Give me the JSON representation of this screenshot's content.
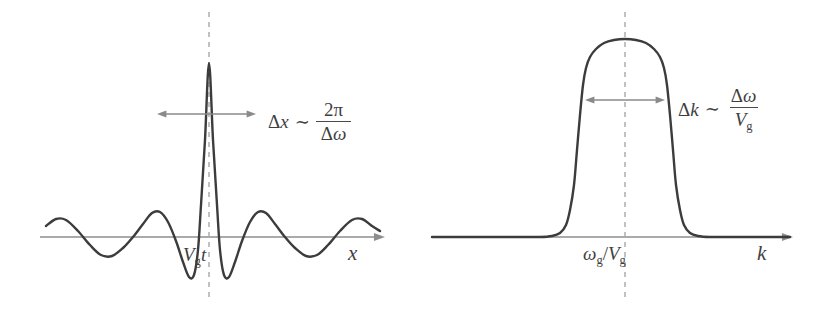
{
  "figure": {
    "background_color": "#ffffff",
    "curve_color": "#3c3c3c",
    "axis_color": "#8e8e8e",
    "dashed_color": "#a8a8a8",
    "text_color": "#3f3f3f"
  },
  "panels": {
    "left": {
      "name": "position-space-wave-packet",
      "axis_label": "x",
      "centre_label": {
        "symbol": "V",
        "subscript": "g",
        "suffix": "t",
        "text": "Vgt"
      },
      "relation": {
        "lhs_delta": "Δ",
        "lhs_var": "x",
        "tilde": "∼",
        "numerator": "2π",
        "denominator_delta": "Δ",
        "denominator_var": "ω",
        "text": "Δx ∼ 2π/Δω"
      }
    },
    "right": {
      "name": "wavenumber-space-spectrum",
      "axis_label": "k",
      "centre_label": {
        "symbol": "ω",
        "subscript": "g",
        "separator": "/",
        "symbol2": "V",
        "subscript2": "g",
        "text": "ωg/Vg"
      },
      "relation": {
        "lhs_delta": "Δ",
        "lhs_var": "k",
        "tilde": "∼",
        "numerator_delta": "Δ",
        "numerator_var": "ω",
        "denominator_var": "V",
        "denominator_sub": "g",
        "text": "Δk ∼ Δω/Vg"
      }
    }
  },
  "chart_data": [
    {
      "type": "line",
      "name": "wave-packet-position-space",
      "panel": "left",
      "title": "",
      "xlabel": "x",
      "ylabel": "",
      "function": "sinc-like modulated wave packet",
      "formula": "A * sin(pi*u)/(pi*u) with u = (x - x0)/w",
      "baseline_y": 237,
      "centre_x": 209,
      "peak_y": 63,
      "amplitude_px": 174,
      "lobe_half_width_px": 48,
      "x_domain_px": [
        46,
        380
      ],
      "grid": false,
      "legend": null,
      "annotations": [
        {
          "text": "Vgt",
          "at_x": 209,
          "at_y": 258,
          "role": "centre-tick-label"
        },
        {
          "text": "Δx ∼ 2π/Δω",
          "at_x": 268,
          "at_y": 114,
          "role": "width-relation"
        }
      ],
      "span_arrow": {
        "y": 114,
        "x_start": 157,
        "x_end": 256
      },
      "dashed_centre": {
        "x": 209,
        "y_start": 12,
        "y_end": 300
      },
      "axis_arrow": {
        "y": 237,
        "x_start": 40,
        "x_end": 385
      },
      "x": [
        -4.0,
        -3.75,
        -3.5,
        -3.25,
        -3.0,
        -2.75,
        -2.5,
        -2.25,
        -2.0,
        -1.75,
        -1.5,
        -1.25,
        -1.0,
        -0.75,
        -0.5,
        -0.25,
        0.0,
        0.25,
        0.5,
        0.75,
        1.0,
        1.25,
        1.5,
        1.75,
        2.0,
        2.25,
        2.5,
        2.75,
        3.0,
        3.25,
        3.5,
        3.75,
        4.0
      ],
      "y": [
        0.0,
        0.075,
        0.091,
        0.038,
        0.0,
        -0.089,
        -0.127,
        -0.069,
        0.0,
        0.127,
        0.212,
        0.129,
        0.0,
        -0.3,
        -0.637,
        -0.42,
        0.0,
        1.0,
        1.0,
        0.9,
        0.0,
        -0.3,
        -0.637,
        -0.42,
        0.0,
        0.127,
        0.212,
        0.129,
        0.0,
        -0.089,
        -0.127,
        -0.069,
        0.0
      ],
      "sample_points_px": [
        [
          46,
          226
        ],
        [
          56,
          219
        ],
        [
          66,
          220
        ],
        [
          78,
          231
        ],
        [
          90,
          245
        ],
        [
          101,
          255
        ],
        [
          112,
          256
        ],
        [
          123,
          248
        ],
        [
          133,
          237
        ],
        [
          143,
          224
        ],
        [
          152,
          213
        ],
        [
          160,
          212
        ],
        [
          168,
          222
        ],
        [
          176,
          241
        ],
        [
          183,
          262
        ],
        [
          189,
          277
        ],
        [
          194,
          275
        ],
        [
          198,
          250
        ],
        [
          201,
          205
        ],
        [
          205,
          140
        ],
        [
          209,
          63
        ],
        [
          213,
          140
        ],
        [
          217,
          205
        ],
        [
          220,
          250
        ],
        [
          224,
          275
        ],
        [
          229,
          277
        ],
        [
          235,
          262
        ],
        [
          242,
          241
        ],
        [
          250,
          222
        ],
        [
          258,
          212
        ],
        [
          266,
          213
        ],
        [
          275,
          224
        ],
        [
          285,
          237
        ],
        [
          295,
          248
        ],
        [
          306,
          256
        ],
        [
          317,
          255
        ],
        [
          328,
          245
        ],
        [
          340,
          231
        ],
        [
          352,
          220
        ],
        [
          362,
          219
        ],
        [
          372,
          226
        ],
        [
          380,
          231
        ]
      ]
    },
    {
      "type": "line",
      "name": "spectrum-wavenumber-space",
      "panel": "right",
      "title": "",
      "xlabel": "k",
      "ylabel": "",
      "function": "flat-top super-Gaussian spectrum",
      "formula": "exp(-((k - k0)/w)^8)",
      "baseline_y": 237,
      "centre_x": 625,
      "peak_y": 39,
      "amplitude_px": 198,
      "flat_top_half_width_px": 40,
      "x_domain_px": [
        432,
        790
      ],
      "grid": false,
      "legend": null,
      "annotations": [
        {
          "text": "ωg/Vg",
          "at_x": 625,
          "at_y": 258,
          "role": "centre-tick-label"
        },
        {
          "text": "Δk ∼ Δω/Vg",
          "at_x": 678,
          "at_y": 100,
          "role": "width-relation"
        }
      ],
      "span_arrow": {
        "y": 100,
        "x_start": 585,
        "x_end": 665
      },
      "dashed_centre": {
        "x": 625,
        "y_start": 12,
        "y_end": 300
      },
      "axis_arrow": {
        "y": 237,
        "x_start": 432,
        "x_end": 793
      },
      "x": [
        -3.0,
        -2.5,
        -2.0,
        -1.8,
        -1.6,
        -1.4,
        -1.3,
        -1.2,
        -1.1,
        -1.0,
        -0.9,
        -0.8,
        -0.6,
        -0.4,
        -0.2,
        0.0,
        0.2,
        0.4,
        0.6,
        0.8,
        0.9,
        1.0,
        1.1,
        1.2,
        1.3,
        1.4,
        1.6,
        1.8,
        2.0,
        2.5,
        3.0
      ],
      "y": [
        0.0,
        0.0,
        0.0,
        0.0,
        0.002,
        0.01,
        0.03,
        0.09,
        0.22,
        0.45,
        0.7,
        0.87,
        0.975,
        0.995,
        1.0,
        1.0,
        1.0,
        0.995,
        0.975,
        0.87,
        0.7,
        0.45,
        0.22,
        0.09,
        0.03,
        0.01,
        0.002,
        0.0,
        0.0,
        0.0,
        0.0
      ],
      "sample_points_px": [
        [
          432,
          237
        ],
        [
          470,
          237
        ],
        [
          510,
          237
        ],
        [
          540,
          237
        ],
        [
          552,
          236
        ],
        [
          560,
          233
        ],
        [
          566,
          225
        ],
        [
          570,
          210
        ],
        [
          574,
          185
        ],
        [
          577,
          150
        ],
        [
          580,
          115
        ],
        [
          583,
          85
        ],
        [
          586,
          68
        ],
        [
          590,
          57
        ],
        [
          596,
          49
        ],
        [
          604,
          43
        ],
        [
          614,
          40
        ],
        [
          625,
          39
        ],
        [
          636,
          40
        ],
        [
          646,
          43
        ],
        [
          654,
          49
        ],
        [
          660,
          57
        ],
        [
          664,
          68
        ],
        [
          667,
          85
        ],
        [
          670,
          115
        ],
        [
          673,
          150
        ],
        [
          676,
          185
        ],
        [
          680,
          210
        ],
        [
          684,
          225
        ],
        [
          690,
          233
        ],
        [
          698,
          236
        ],
        [
          710,
          237
        ],
        [
          740,
          237
        ],
        [
          770,
          237
        ],
        [
          790,
          237
        ]
      ]
    }
  ]
}
